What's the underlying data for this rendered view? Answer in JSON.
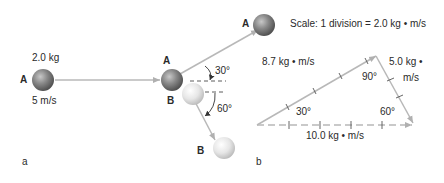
{
  "panel_a": {
    "label": "a",
    "ball_a_mass": "2.0 kg",
    "ball_a_speed": "5 m/s",
    "ball_a_label": "A",
    "collision_a_label": "A",
    "collision_b_label": "B",
    "angle_a": "30°",
    "angle_b": "60°",
    "ball_b_after_label": "B"
  },
  "panel_b": {
    "label": "b",
    "ball_a_label": "A",
    "scale": "Scale: 1 division = 2.0 kg • m/s",
    "side_a_momentum": "8.7 kg • m/s",
    "side_b_momentum_line1": "5.0 kg •",
    "side_b_momentum_line2": "m/s",
    "resultant_momentum": "10.0 kg • m/s",
    "angle_left": "30°",
    "angle_top": "90°",
    "angle_right": "60°"
  },
  "colors": {
    "arrow": "#b8b8b8",
    "dark_ball": "#7a7a7a",
    "light_ball": "#e2e2e2",
    "dash": "#333333"
  }
}
